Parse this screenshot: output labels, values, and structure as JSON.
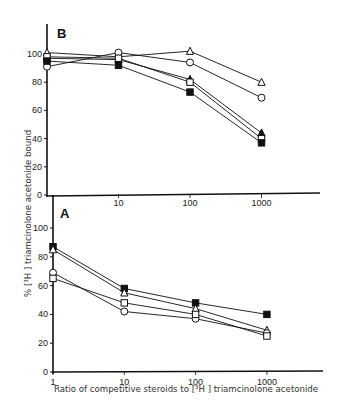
{
  "figure": {
    "ylabel": "% [³H ] triamcinolone acetonide bound",
    "xlabel": "Ratio of competitive steroids to [³H ] triamcinolone acetonide"
  },
  "chart_data": [
    {
      "type": "line",
      "panel": "B",
      "title": "B",
      "xscale": "log",
      "x": [
        1,
        10,
        100,
        1000
      ],
      "x_tick_labels": [
        "10",
        "100",
        "1000"
      ],
      "y_tick_labels": [
        "0",
        "20",
        "40",
        "60",
        "80",
        "100"
      ],
      "ylim": [
        0,
        115
      ],
      "xlabel": "",
      "ylabel": "% [³H ] triamcinolone acetonide bound",
      "grid": false,
      "legend": "none",
      "series": [
        {
          "name": "open-triangle",
          "marker": "triangle-open",
          "values": [
            101,
            98,
            102,
            80
          ]
        },
        {
          "name": "open-circle",
          "marker": "circle-open",
          "values": [
            91,
            101,
            94,
            69
          ]
        },
        {
          "name": "filled-triangle",
          "marker": "triangle-filled",
          "values": [
            97,
            96,
            82,
            44
          ]
        },
        {
          "name": "open-square",
          "marker": "square-open",
          "values": [
            98,
            97,
            80,
            40
          ]
        },
        {
          "name": "filled-square",
          "marker": "square-filled",
          "values": [
            95,
            92,
            73,
            37
          ]
        }
      ]
    },
    {
      "type": "line",
      "panel": "A",
      "title": "A",
      "xscale": "log",
      "x": [
        1,
        10,
        100,
        1000
      ],
      "x_tick_labels": [
        "1",
        "10",
        "100",
        "1000"
      ],
      "y_tick_labels": [
        "0",
        "20",
        "40",
        "60",
        "80",
        "100"
      ],
      "ylim": [
        0,
        110
      ],
      "xlabel": "Ratio of competitive steroids to [³H ] triamcinolone acetonide",
      "ylabel": "% [³H ] triamcinolone acetonide bound",
      "grid": false,
      "legend": "none",
      "series": [
        {
          "name": "filled-square",
          "marker": "square-filled",
          "values": [
            87,
            58,
            48,
            40
          ]
        },
        {
          "name": "open-triangle",
          "marker": "triangle-open",
          "values": [
            85,
            55,
            44,
            29
          ]
        },
        {
          "name": "open-circle",
          "marker": "circle-open",
          "values": [
            69,
            42,
            37,
            27
          ]
        },
        {
          "name": "open-square",
          "marker": "square-open",
          "values": [
            65,
            48,
            40,
            25
          ]
        }
      ]
    }
  ]
}
